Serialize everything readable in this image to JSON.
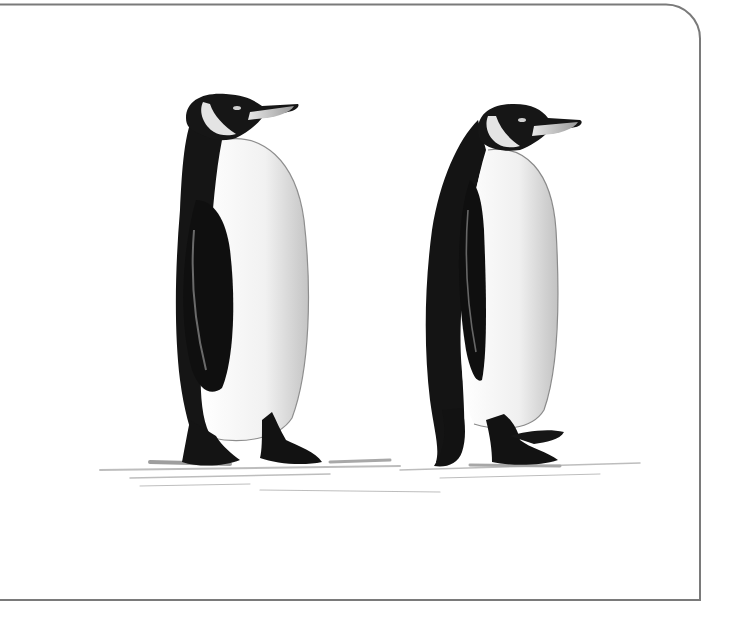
{
  "image": {
    "subject": "Pencil-and-ink illustration of two king penguins walking on snow",
    "background": "#ffffff",
    "frame": {
      "stroke": "#7a7a7a",
      "corner": "rounded top-right"
    },
    "figures": [
      {
        "name": "left-penguin",
        "facing": "right",
        "pose": "standing"
      },
      {
        "name": "right-penguin",
        "facing": "right",
        "pose": "walking"
      }
    ],
    "colors": {
      "plumage_dark": "#141414",
      "belly": "#f2f2f2",
      "belly_shade": "#c9c9c9",
      "beak_light": "#d8d8d8",
      "ground_shadow": "#9a9a9a"
    }
  }
}
